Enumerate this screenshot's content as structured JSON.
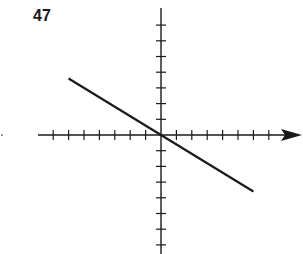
{
  "problem": {
    "number": "47"
  },
  "chart_data": {
    "type": "line",
    "title": "",
    "xlabel": "",
    "ylabel": "",
    "grid": false,
    "legend": null,
    "axes": {
      "x_ticks_left": 7,
      "x_ticks_right": 7,
      "y_ticks_up": 7,
      "y_ticks_down": 7,
      "x_arrow": "positive",
      "tick_labels": false
    },
    "xlim": [
      -8,
      9
    ],
    "ylim": [
      -8,
      8
    ],
    "series": [
      {
        "name": "line",
        "x": [
          -6,
          6
        ],
        "y": [
          3.6,
          -3.6
        ],
        "slope": -0.6,
        "intercept": 0,
        "color": "#1a1a1a"
      }
    ]
  },
  "style": {
    "ink": "#1a1a1a",
    "background": "#ffffff"
  }
}
